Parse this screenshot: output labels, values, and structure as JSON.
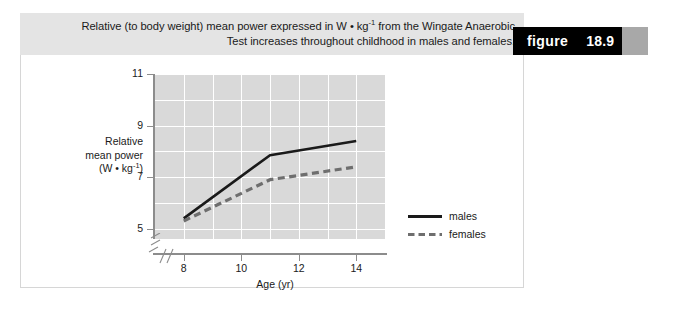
{
  "caption": {
    "line1_pre": "Relative (to body weight) mean power expressed in W • kg",
    "line1_sup": "-1",
    "line1_post": " from the Wingate Anaerobic",
    "line2": "Test increases throughout childhood in males and females."
  },
  "badge": {
    "word": "figure",
    "number": "18.9"
  },
  "chart_data": {
    "type": "line",
    "title": "",
    "xlabel": "Age (yr)",
    "ylabel_line1": "Relative",
    "ylabel_line2": "mean power",
    "ylabel_line3_pre": "(W • kg",
    "ylabel_line3_sup": "-1",
    "ylabel_line3_post": ")",
    "x": [
      8,
      11,
      14
    ],
    "xlim": [
      7,
      15
    ],
    "ylim": [
      4.6,
      11
    ],
    "xticks": [
      "8",
      "10",
      "12",
      "14"
    ],
    "xtick_values": [
      8,
      10,
      12,
      14
    ],
    "yticks": [
      "5",
      "7",
      "9",
      "11"
    ],
    "ytick_values": [
      5,
      7,
      9,
      11
    ],
    "y_gridlines": [
      6,
      8,
      10
    ],
    "x_gridlines": [
      9,
      11,
      13
    ],
    "grid": true,
    "axis_break": true,
    "legend_position": "right",
    "series": [
      {
        "name": "males",
        "style": "solid",
        "color": "#1a1a1a",
        "values": [
          5.4,
          7.85,
          8.4
        ]
      },
      {
        "name": "females",
        "style": "dashed",
        "color": "#6e6e6e",
        "values": [
          5.3,
          6.9,
          7.4
        ]
      }
    ]
  },
  "colors": {
    "caption_band": "#e4e4e4",
    "badge_black": "#000000",
    "badge_gray": "#a8a8a8",
    "plot_bg": "#d9d9d9",
    "grid": "#ffffff",
    "axis": "#8c8c8c"
  }
}
